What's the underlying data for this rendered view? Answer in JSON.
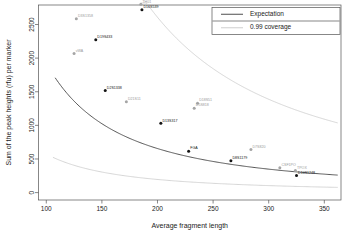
{
  "chart_data": {
    "type": "scatter",
    "title": "",
    "xlabel": "Average fragment length",
    "ylabel": "Sum of the peak heights (rfu) per marker",
    "xlim": [
      93,
      365
    ],
    "ylim": [
      -110,
      2790
    ],
    "xticks": [
      100,
      150,
      200,
      250,
      300,
      350
    ],
    "yticks": [
      0,
      500,
      1000,
      1500,
      2000,
      2500
    ],
    "grid": false,
    "legend_position": "top-right",
    "legend": [
      {
        "label": "Expectation",
        "color": "#3a3a3a",
        "style": "line"
      },
      {
        "label": "0.99 coverage",
        "color": "#c8c8c8",
        "style": "line"
      }
    ],
    "points": [
      {
        "label": "D3S1358",
        "x": 127,
        "y": 2585,
        "color": "grey"
      },
      {
        "label": "D19S433",
        "x": 144.5,
        "y": 2275,
        "color": "black"
      },
      {
        "label": "vWA",
        "x": 125,
        "y": 2070,
        "color": "grey"
      },
      {
        "label": "TH01",
        "x": 185,
        "y": 2800,
        "color": "grey"
      },
      {
        "label": "D16S539",
        "x": 186,
        "y": 2720,
        "color": "black"
      },
      {
        "label": "D2S1338",
        "x": 153,
        "y": 1520,
        "color": "black"
      },
      {
        "label": "D21S11",
        "x": 172,
        "y": 1350,
        "color": "grey"
      },
      {
        "label": "D18S51",
        "x": 236,
        "y": 1330,
        "color": "grey"
      },
      {
        "label": "D5S818",
        "x": 233,
        "y": 1255,
        "color": "grey"
      },
      {
        "label": "D13S317",
        "x": 203,
        "y": 1030,
        "color": "black"
      },
      {
        "label": "FGA",
        "x": 228,
        "y": 615,
        "color": "black"
      },
      {
        "label": "D7S820",
        "x": 284,
        "y": 640,
        "color": "grey"
      },
      {
        "label": "D8S1179",
        "x": 266,
        "y": 475,
        "color": "black"
      },
      {
        "label": "CSF1PO",
        "x": 310,
        "y": 370,
        "color": "grey"
      },
      {
        "label": "TPOX",
        "x": 324,
        "y": 330,
        "color": "grey"
      },
      {
        "label": "D10S1248",
        "x": 325,
        "y": 255,
        "color": "black"
      }
    ],
    "curves": [
      {
        "name": "Expectation",
        "color": "#3a3a3a",
        "model": "power",
        "coefficient": 2480000,
        "exponent": 1.555,
        "x_start": 108,
        "x_end": 362
      },
      {
        "name": "0.99 coverage upper",
        "color": "#c8c8c8",
        "model": "power",
        "coefficient": 9870000,
        "exponent": 1.555,
        "x_start": 185,
        "x_end": 362
      },
      {
        "name": "0.99 coverage lower",
        "color": "#c8c8c8",
        "model": "power",
        "coefficient": 740000,
        "exponent": 1.555,
        "x_start": 106,
        "x_end": 362
      }
    ]
  }
}
